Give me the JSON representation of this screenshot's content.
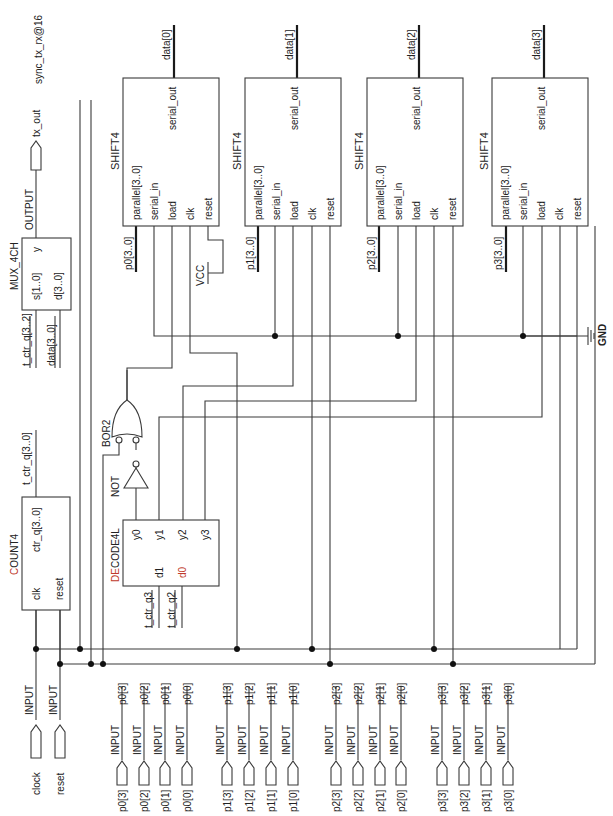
{
  "diagram": {
    "title": "sync_tx_rx@16",
    "orientation": "rotated-90-ccw"
  },
  "inputs": {
    "clock": {
      "type": "INPUT",
      "name": "clock"
    },
    "reset": {
      "type": "INPUT",
      "name": "reset"
    },
    "parallel": [
      {
        "type": "INPUT",
        "net": "p0[3]",
        "name": "p0[3]"
      },
      {
        "type": "INPUT",
        "net": "p0[2]",
        "name": "p0[2]"
      },
      {
        "type": "INPUT",
        "net": "p0[1]",
        "name": "p0[1]"
      },
      {
        "type": "INPUT",
        "net": "p0[0]",
        "name": "p0[0]"
      },
      {
        "type": "INPUT",
        "net": "p1[3]",
        "name": "p1[3]"
      },
      {
        "type": "INPUT",
        "net": "p1[2]",
        "name": "p1[2]"
      },
      {
        "type": "INPUT",
        "net": "p1[1]",
        "name": "p1[1]"
      },
      {
        "type": "INPUT",
        "net": "p1[0]",
        "name": "p1[0]"
      },
      {
        "type": "INPUT",
        "net": "p2[3]",
        "name": "p2[3]"
      },
      {
        "type": "INPUT",
        "net": "p2[2]",
        "name": "p2[2]"
      },
      {
        "type": "INPUT",
        "net": "p2[1]",
        "name": "p2[1]"
      },
      {
        "type": "INPUT",
        "net": "p2[0]",
        "name": "p2[0]"
      },
      {
        "type": "INPUT",
        "net": "p3[3]",
        "name": "p3[3]"
      },
      {
        "type": "INPUT",
        "net": "p3[2]",
        "name": "p3[2]"
      },
      {
        "type": "INPUT",
        "net": "p3[1]",
        "name": "p3[1]"
      },
      {
        "type": "INPUT",
        "net": "p3[0]",
        "name": "p3[0]"
      }
    ]
  },
  "output": {
    "type": "OUTPUT",
    "name": "tx_out"
  },
  "count4": {
    "name": "COUNT4",
    "name_first": "C",
    "name_rest": "OUNT4",
    "pins": {
      "clk": "clk",
      "reset": "reset",
      "ctr_q": "ctr_q[3..0]"
    },
    "out_net": "t_ctr_q[3..0]"
  },
  "decode": {
    "name": "DECODE4L",
    "name_first": "DE",
    "name_rest": "CODE4L",
    "pins": {
      "d1": "d1",
      "d0": "d0",
      "y0": "y0",
      "y1": "y1",
      "y2": "y2",
      "y3": "y3"
    },
    "in_nets": {
      "d1": "t_ctr_q3",
      "d0": "t_ctr_q2"
    }
  },
  "not_gate": {
    "name": "NOT"
  },
  "or_gate": {
    "name": "BOR2"
  },
  "mux": {
    "name": "MUX_4CH",
    "pins": {
      "s": "s[1..0]",
      "d": "d[3..0]",
      "y": "y"
    },
    "in_nets": {
      "s": "t_ctr_q[3..2]",
      "d": "data[3..0]"
    }
  },
  "vcc": {
    "name": "VCC"
  },
  "gnd": {
    "name": "GND"
  },
  "shift_registers": [
    {
      "name": "SHIFT4",
      "in_net": "p0[3..0]",
      "out_net": "data[0]",
      "pins": {
        "parallel": "parallel[3..0]",
        "serial_in": "serial_in",
        "load": "load",
        "clk": "clk",
        "reset": "reset",
        "serial_out": "serial_out"
      }
    },
    {
      "name": "SHIFT4",
      "in_net": "p1[3..0]",
      "out_net": "data[1]",
      "pins": {
        "parallel": "parallel[3..0]",
        "serial_in": "serial_in",
        "load": "load",
        "clk": "clk",
        "reset": "reset",
        "serial_out": "serial_out"
      }
    },
    {
      "name": "SHIFT4",
      "in_net": "p2[3..0]",
      "out_net": "data[2]",
      "pins": {
        "parallel": "parallel[3..0]",
        "serial_in": "serial_in",
        "load": "load",
        "clk": "clk",
        "reset": "reset",
        "serial_out": "serial_out"
      }
    },
    {
      "name": "SHIFT4",
      "in_net": "p3[3..0]",
      "out_net": "data[3]",
      "pins": {
        "parallel": "parallel[3..0]",
        "serial_in": "serial_in",
        "load": "load",
        "clk": "clk",
        "reset": "reset",
        "serial_out": "serial_out"
      }
    }
  ],
  "colors": {
    "wire": "#3a3a3a",
    "bus": "#1a1a1a",
    "accent_red": "#c0392b",
    "accent_green": "#4caf50",
    "accent_magenta": "#b04cb0"
  }
}
